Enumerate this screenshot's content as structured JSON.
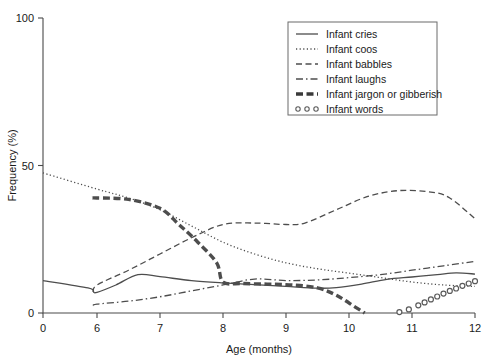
{
  "chart_data": {
    "type": "line",
    "title": "",
    "xlabel": "Age (months)",
    "ylabel": "Frequency (%)",
    "xlim": [
      0,
      12
    ],
    "ylim": [
      0,
      100
    ],
    "xticks": [
      0,
      6,
      7,
      8,
      9,
      10,
      11,
      12
    ],
    "xtick_labels": [
      "0",
      "6",
      "7",
      "8",
      "9",
      "10",
      "11",
      "12"
    ],
    "yticks": [
      0,
      50,
      100
    ],
    "ytick_labels": [
      "0",
      "50",
      "100"
    ],
    "grid": false,
    "legend_position": "top-right",
    "note": "x-axis is compressed between 0 and 6; months 6-12 are evenly spaced",
    "series": [
      {
        "name": "Infant cries",
        "style": "solid",
        "marker": "none",
        "color": "#4d4d4d",
        "x": [
          0,
          5.0,
          5.6,
          6.0,
          6.3,
          6.65,
          7.0,
          7.5,
          8.0,
          8.5,
          9.0,
          9.5,
          9.8,
          10.2,
          10.6,
          11.0,
          11.4,
          11.7,
          12.0
        ],
        "y": [
          11,
          8.5,
          7.2,
          7.0,
          9.5,
          13.0,
          12.3,
          11.0,
          10.2,
          9.6,
          9.0,
          8.4,
          8.6,
          9.8,
          11.4,
          12.2,
          13.0,
          13.6,
          13.2
        ]
      },
      {
        "name": "Infant coos",
        "style": "dotted",
        "marker": "none",
        "color": "#4d4d4d",
        "x": [
          0,
          6.0,
          6.5,
          7.0,
          7.5,
          8.0,
          8.5,
          9.0,
          9.5,
          10.0,
          10.5,
          11.0,
          11.5,
          12.0
        ],
        "y": [
          47.5,
          42.0,
          39.0,
          35.0,
          29.5,
          24.0,
          20.0,
          17.0,
          15.0,
          13.5,
          12.0,
          10.5,
          9.5,
          9.0
        ]
      },
      {
        "name": "Infant babbles",
        "style": "dashed",
        "marker": "none",
        "color": "#4d4d4d",
        "x": [
          5.6,
          6.0,
          6.5,
          7.0,
          7.5,
          8.0,
          8.5,
          9.0,
          9.3,
          9.8,
          10.3,
          10.8,
          11.3,
          11.6,
          12.0
        ],
        "y": [
          7.0,
          9.5,
          14.5,
          20.0,
          25.5,
          30.0,
          30.5,
          30.0,
          30.5,
          35.0,
          39.5,
          41.5,
          41.0,
          39.0,
          32.0
        ]
      },
      {
        "name": "Infant laughs",
        "style": "dashdot",
        "marker": "none",
        "color": "#4d4d4d",
        "x": [
          5.6,
          6.0,
          6.5,
          7.0,
          7.5,
          8.0,
          8.5,
          9.0,
          9.5,
          10.0,
          10.5,
          11.0,
          11.5,
          12.0
        ],
        "y": [
          2.5,
          3.0,
          4.0,
          5.5,
          7.5,
          9.5,
          11.5,
          11.0,
          11.2,
          12.0,
          13.0,
          14.5,
          16.0,
          17.5
        ]
      },
      {
        "name": "Infant jargon or gibberish",
        "style": "thick-dashed",
        "marker": "none",
        "color": "#3a3a3a",
        "x": [
          5.5,
          6.0,
          6.5,
          7.0,
          7.3,
          7.6,
          7.9,
          8.0,
          8.3,
          8.7,
          9.1,
          9.5,
          9.8,
          10.1,
          10.25
        ],
        "y": [
          39.0,
          39.0,
          38.5,
          35.5,
          30.0,
          24.0,
          17.0,
          10.5,
          10.0,
          9.8,
          9.5,
          8.5,
          6.0,
          2.0,
          0.0
        ]
      },
      {
        "name": "Infant words",
        "style": "circles",
        "marker": "o",
        "color": "#5a5a5a",
        "x": [
          10.8,
          10.95,
          11.1,
          11.2,
          11.3,
          11.4,
          11.5,
          11.6,
          11.7,
          11.8,
          11.9,
          12.0
        ],
        "y": [
          0.3,
          1.2,
          2.6,
          3.6,
          4.6,
          5.6,
          6.6,
          7.5,
          8.3,
          9.2,
          10.0,
          10.8
        ]
      }
    ]
  },
  "legend": {
    "items": [
      {
        "label": "Infant cries",
        "style": "solid"
      },
      {
        "label": "Infant coos",
        "style": "dotted"
      },
      {
        "label": "Infant babbles",
        "style": "dashed"
      },
      {
        "label": "Infant laughs",
        "style": "dashdot"
      },
      {
        "label": "Infant jargon or gibberish",
        "style": "thick-dashed"
      },
      {
        "label": "Infant words",
        "style": "circles"
      }
    ]
  }
}
